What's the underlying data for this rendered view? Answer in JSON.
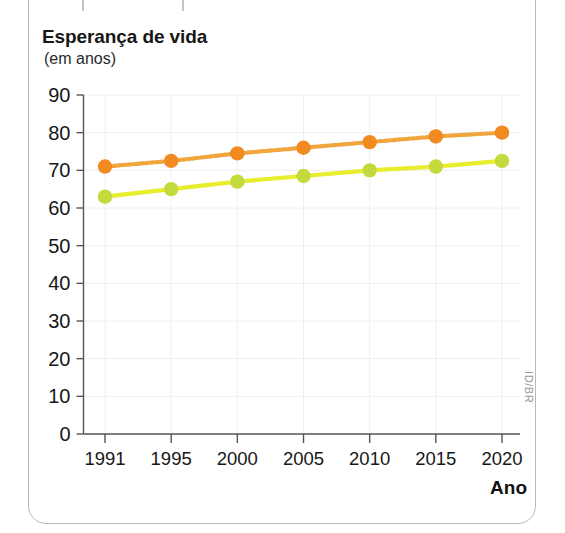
{
  "chart_data": {
    "type": "line",
    "title": "Esperança de vida",
    "subtitle": "(em anos)",
    "xlabel": "Ano",
    "ylabel": "",
    "categories": [
      "1991",
      "1995",
      "2000",
      "2005",
      "2010",
      "2015",
      "2020"
    ],
    "x": [
      1991,
      1995,
      2000,
      2005,
      2010,
      2015,
      2020
    ],
    "series": [
      {
        "name": "orange-series",
        "color": "#F08A21",
        "line_color": "#F0A63C",
        "line_style": "dotted",
        "values": [
          71,
          72.5,
          74.5,
          76,
          77.5,
          79,
          80
        ]
      },
      {
        "name": "yellow-green-series",
        "color": "#C4D93B",
        "line_color": "#E8ED2E",
        "line_style": "solid",
        "values": [
          63,
          65,
          67,
          68.5,
          70,
          71,
          72.5
        ]
      }
    ],
    "ylim": [
      0,
      90
    ],
    "yticks": [
      0,
      10,
      20,
      30,
      40,
      50,
      60,
      70,
      80,
      90
    ],
    "ytick_labels": [
      "0",
      "10",
      "20",
      "30",
      "40",
      "50",
      "60",
      "70",
      "80",
      "90"
    ],
    "grid": true,
    "grid_color": "#f0f0f0",
    "legend": "none",
    "axis_color": "#555555"
  },
  "watermark": {
    "text": "ID/BR"
  }
}
